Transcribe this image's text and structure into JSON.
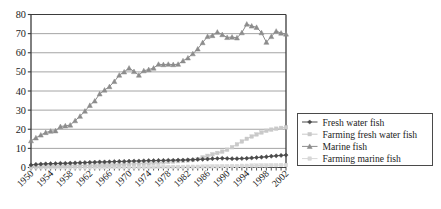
{
  "chart_data": {
    "type": "line",
    "title": "",
    "xlabel": "",
    "ylabel": "",
    "ylim": [
      0,
      80
    ],
    "yticks": [
      0,
      10,
      20,
      30,
      40,
      50,
      60,
      70,
      80
    ],
    "grid": true,
    "legend_position": "right",
    "x": [
      1950,
      1951,
      1952,
      1953,
      1954,
      1955,
      1956,
      1957,
      1958,
      1959,
      1960,
      1961,
      1962,
      1963,
      1964,
      1965,
      1966,
      1967,
      1968,
      1969,
      1970,
      1971,
      1972,
      1973,
      1974,
      1975,
      1976,
      1977,
      1978,
      1979,
      1980,
      1981,
      1982,
      1983,
      1984,
      1985,
      1986,
      1987,
      1988,
      1989,
      1990,
      1991,
      1992,
      1993,
      1994,
      1995,
      1996,
      1997,
      1998,
      1999,
      2000,
      2001,
      2002
    ],
    "xtick_labels": [
      "1950",
      "1954",
      "1958",
      "1962",
      "1966",
      "1970",
      "1974",
      "1978",
      "1982",
      "1986",
      "1990",
      "1994",
      "1998",
      "2002"
    ],
    "series": [
      {
        "name": "Fresh water fish",
        "color": "#4a4a4a",
        "marker": "diamond",
        "values": [
          1.3,
          1.6,
          1.8,
          1.9,
          2.0,
          2.1,
          2.2,
          2.2,
          2.3,
          2.4,
          2.5,
          2.6,
          2.7,
          2.8,
          2.9,
          2.9,
          3.0,
          3.1,
          3.2,
          3.2,
          3.3,
          3.4,
          3.4,
          3.5,
          3.6,
          3.6,
          3.7,
          3.7,
          3.8,
          3.8,
          3.9,
          3.9,
          4.0,
          4.1,
          4.2,
          4.3,
          4.4,
          4.6,
          4.7,
          4.8,
          4.7,
          4.6,
          4.6,
          4.7,
          4.8,
          5.0,
          5.2,
          5.4,
          5.6,
          5.9,
          6.1,
          6.3,
          6.5
        ]
      },
      {
        "name": "Farming fresh water fish",
        "color": "#c9c9c9",
        "marker": "square",
        "values": [
          0.5,
          0.5,
          0.6,
          0.6,
          0.7,
          0.7,
          0.8,
          0.8,
          0.9,
          0.9,
          1.0,
          1.1,
          1.1,
          1.2,
          1.3,
          1.3,
          1.4,
          1.5,
          1.6,
          1.7,
          1.8,
          1.9,
          2.0,
          2.1,
          2.2,
          2.4,
          2.5,
          2.7,
          2.9,
          3.1,
          3.3,
          3.5,
          3.7,
          3.9,
          4.4,
          5.3,
          6.1,
          6.9,
          7.6,
          8.3,
          9.3,
          10.6,
          12.1,
          13.6,
          15.0,
          16.2,
          17.3,
          18.3,
          19.2,
          19.8,
          20.3,
          20.7,
          21.0
        ]
      },
      {
        "name": "Marine fish",
        "color": "#8c8c8c",
        "marker": "triangle",
        "values": [
          14.0,
          15.5,
          17.0,
          18.3,
          19.0,
          19.2,
          21.4,
          21.8,
          22.2,
          24.5,
          26.8,
          29.5,
          32.5,
          34.8,
          38.5,
          40.5,
          42.3,
          45.0,
          48.3,
          50.0,
          52.0,
          50.2,
          48.3,
          50.6,
          51.2,
          52.0,
          54.0,
          53.8,
          54.0,
          53.8,
          54.0,
          55.8,
          57.3,
          59.5,
          62.0,
          65.3,
          68.5,
          69.0,
          70.8,
          69.5,
          68.0,
          68.2,
          67.8,
          70.5,
          75.0,
          74.0,
          73.3,
          70.5,
          65.5,
          68.5,
          71.3,
          70.3,
          69.8
        ]
      },
      {
        "name": "Farming marine fish",
        "color": "#d8d8d8",
        "marker": "square",
        "values": [
          0.1,
          0.1,
          0.1,
          0.1,
          0.1,
          0.1,
          0.1,
          0.1,
          0.1,
          0.1,
          0.1,
          0.1,
          0.1,
          0.1,
          0.1,
          0.1,
          0.2,
          0.2,
          0.2,
          0.2,
          0.2,
          0.2,
          0.2,
          0.2,
          0.2,
          0.2,
          0.3,
          0.3,
          0.3,
          0.3,
          0.3,
          0.3,
          0.4,
          0.4,
          0.4,
          0.5,
          0.5,
          0.6,
          0.6,
          0.7,
          0.7,
          0.8,
          0.8,
          0.9,
          0.9,
          1.0,
          1.0,
          1.1,
          1.1,
          1.2,
          1.2,
          1.3,
          1.3
        ]
      }
    ]
  },
  "legend": {
    "entries": [
      {
        "label": "Fresh water fish"
      },
      {
        "label": "Farming fresh water fish"
      },
      {
        "label": "Marine fish"
      },
      {
        "label": "Farming marine fish"
      }
    ]
  },
  "colors": {
    "axis": "#3b3b3b",
    "grid": "#8d8d8d",
    "text": "#1c1c1c",
    "background": "#ffffff",
    "legend_border": "#4a4a4a"
  }
}
